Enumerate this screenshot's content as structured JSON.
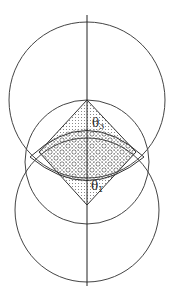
{
  "diagram": {
    "labels": {
      "theta_top": {
        "symbol": "θ",
        "subscript": "3"
      },
      "theta_bottom": {
        "symbol": "θ",
        "subscript": "1"
      }
    },
    "colors": {
      "line": "#333333",
      "background": "#ffffff",
      "hatch": "#888888"
    }
  }
}
